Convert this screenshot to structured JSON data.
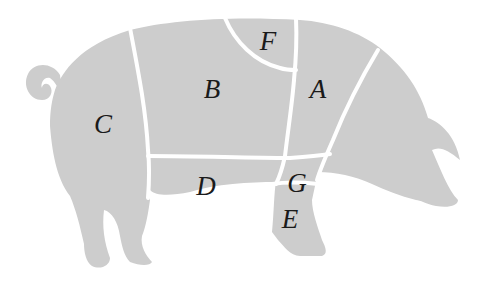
{
  "diagram": {
    "style": {
      "body_fill": "#cdcdcd",
      "divider_color": "#ffffff",
      "label_color": "#1a1a1a",
      "background": "#ffffff"
    },
    "regions": [
      {
        "id": "A",
        "label": "A",
        "x": 318,
        "y": 98
      },
      {
        "id": "B",
        "label": "B",
        "x": 212,
        "y": 98
      },
      {
        "id": "C",
        "label": "C",
        "x": 103,
        "y": 133
      },
      {
        "id": "D",
        "label": "D",
        "x": 206,
        "y": 195
      },
      {
        "id": "E",
        "label": "E",
        "x": 290,
        "y": 228
      },
      {
        "id": "F",
        "label": "F",
        "x": 268,
        "y": 50
      },
      {
        "id": "G",
        "label": "G",
        "x": 297,
        "y": 192
      }
    ]
  }
}
